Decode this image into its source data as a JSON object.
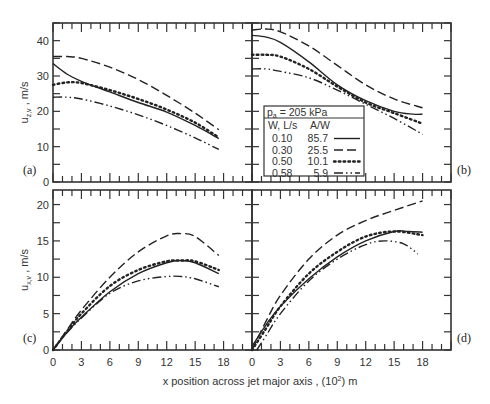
{
  "chart_data": {
    "type": "line",
    "xlabel": "x position across jet major axis , (10",
    "xlabel_sup": "2",
    "xlabel_tail": ") m",
    "x_ticks": [
      0,
      3,
      6,
      9,
      12,
      15,
      18
    ],
    "legend": {
      "header": "p",
      "header_sub": "a",
      "header_tail": " = 205 kPa",
      "col1": "W, L/s",
      "col2": "A/W",
      "entries": [
        {
          "w": "0.10",
          "aw": "85.7",
          "style": "solid"
        },
        {
          "w": "0.30",
          "aw": "25.5",
          "style": "dashed"
        },
        {
          "w": "0.50",
          "aw": "10.1",
          "style": "dotted"
        },
        {
          "w": "0.58",
          "aw": "5.9",
          "style": "dashdotdot"
        }
      ],
      "placement": "panel-b-lower-left"
    },
    "panels": [
      {
        "id": "a",
        "label": "(a)",
        "ylabel": "u",
        "ylabel_sub": "z,v",
        "ylabel_tail": " , m/s",
        "ylim": [
          0,
          45
        ],
        "xlim": [
          0,
          21
        ],
        "y_ticks": [
          0,
          10,
          20,
          30,
          40
        ],
        "series": [
          {
            "name": "0.10",
            "style": "solid",
            "x": [
              0,
              1.5,
              3,
              6,
              9,
              12,
              15,
              17.5
            ],
            "y": [
              33.5,
              30.5,
              28.5,
              25.5,
              22.5,
              19.8,
              16,
              12.3
            ]
          },
          {
            "name": "0.30",
            "style": "dashed",
            "x": [
              0,
              1.5,
              3,
              6,
              9,
              12,
              15,
              17.5
            ],
            "y": [
              35.5,
              35.5,
              35,
              32.5,
              29,
              24.5,
              19.5,
              14.8
            ]
          },
          {
            "name": "0.50",
            "style": "dotted",
            "x": [
              0,
              1.5,
              3,
              6,
              9,
              12,
              15,
              17.5
            ],
            "y": [
              27.5,
              28.2,
              28,
              26,
              23.5,
              20.5,
              16.8,
              12.6
            ]
          },
          {
            "name": "0.58",
            "style": "dashdotdot",
            "x": [
              0,
              1.5,
              3,
              6,
              9,
              12,
              15,
              17.5
            ],
            "y": [
              24,
              24,
              23.5,
              21.5,
              19,
              16,
              12.5,
              9.2
            ]
          }
        ]
      },
      {
        "id": "b",
        "label": "(b)",
        "ylim": [
          0,
          45
        ],
        "xlim": [
          0,
          21
        ],
        "y_ticks": [
          0,
          10,
          20,
          30,
          40
        ],
        "series": [
          {
            "name": "0.10",
            "style": "solid",
            "x": [
              0,
              1.5,
              3,
              6,
              9,
              12,
              15,
              17,
              18
            ],
            "y": [
              41.5,
              41,
              39.5,
              34,
              27.5,
              23,
              20,
              19.2,
              19.2
            ]
          },
          {
            "name": "0.30",
            "style": "dashed",
            "x": [
              0,
              1.5,
              3,
              6,
              9,
              12,
              15,
              18
            ],
            "y": [
              43,
              43.3,
              42.5,
              38.5,
              33,
              27.5,
              23.5,
              21
            ]
          },
          {
            "name": "0.50",
            "style": "dotted",
            "x": [
              0,
              1.5,
              3,
              6,
              9,
              12,
              15,
              18
            ],
            "y": [
              36,
              36,
              35.5,
              32,
              27,
              22.5,
              19.5,
              16.5
            ]
          },
          {
            "name": "0.58",
            "style": "dashdotdot",
            "x": [
              0,
              1.5,
              3,
              6,
              9,
              12,
              15,
              18
            ],
            "y": [
              32,
              32,
              31.3,
              29.5,
              26,
              22,
              18,
              13.5
            ]
          }
        ]
      },
      {
        "id": "c",
        "label": "(c)",
        "ylabel": "u",
        "ylabel_sub": "x,v",
        "ylabel_tail": " , m/s",
        "ylim": [
          0,
          22
        ],
        "xlim": [
          0,
          21
        ],
        "y_ticks": [
          0,
          5,
          10,
          15,
          20
        ],
        "series": [
          {
            "name": "0.10",
            "style": "solid",
            "x": [
              0,
              1.5,
              3,
              6,
              9,
              12,
              13.5,
              15,
              17.5
            ],
            "y": [
              0,
              2.5,
              4.5,
              8,
              10.5,
              12,
              12.3,
              12,
              10.5
            ]
          },
          {
            "name": "0.30",
            "style": "dashed",
            "x": [
              0,
              1.5,
              3,
              6,
              9,
              12,
              13.5,
              15,
              17.5
            ],
            "y": [
              0,
              2.8,
              5.5,
              10,
              13.5,
              15.7,
              16,
              15.6,
              13
            ]
          },
          {
            "name": "0.50",
            "style": "dotted",
            "x": [
              0,
              1.5,
              3,
              6,
              9,
              12,
              13.5,
              15,
              17.5
            ],
            "y": [
              0,
              2.6,
              5,
              8.8,
              11,
              12.2,
              12.3,
              12.2,
              11
            ]
          },
          {
            "name": "0.58",
            "style": "dashdotdot",
            "x": [
              0,
              1.5,
              3,
              6,
              9,
              12,
              13.5,
              15,
              17.5
            ],
            "y": [
              0,
              2.4,
              4.4,
              7.8,
              9.5,
              10.1,
              10.1,
              9.8,
              8.7
            ]
          }
        ]
      },
      {
        "id": "d",
        "label": "(d)",
        "ylim": [
          0,
          22
        ],
        "xlim": [
          0,
          21
        ],
        "y_ticks": [
          0,
          5,
          10,
          15,
          20
        ],
        "series": [
          {
            "name": "0.10",
            "style": "solid",
            "x": [
              0,
              1.5,
              3,
              6,
              9,
              12,
              15,
              16.5,
              18
            ],
            "y": [
              0.5,
              3.5,
              6,
              9.8,
              12.8,
              15,
              16.3,
              16.3,
              16.2
            ]
          },
          {
            "name": "0.30",
            "style": "dashed",
            "x": [
              0,
              1.5,
              3,
              6,
              9,
              12,
              15,
              18
            ],
            "y": [
              0,
              4,
              7.5,
              12.5,
              15.8,
              17.8,
              19.2,
              20.5
            ]
          },
          {
            "name": "0.50",
            "style": "dotted",
            "x": [
              0,
              1.5,
              3,
              6,
              9,
              12,
              15,
              18
            ],
            "y": [
              0,
              3,
              6,
              10.5,
              13.5,
              15.6,
              16.3,
              15.8
            ]
          },
          {
            "name": "0.58",
            "style": "dashdotdot",
            "x": [
              0.5,
              1.5,
              3,
              6,
              9,
              12,
              14,
              16,
              17.5
            ],
            "y": [
              0,
              2,
              5,
              9.5,
              12.5,
              14.5,
              15,
              14.6,
              13.2
            ]
          }
        ]
      }
    ]
  }
}
